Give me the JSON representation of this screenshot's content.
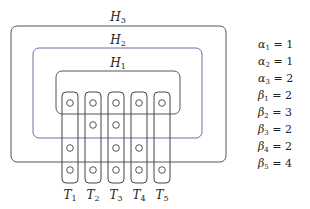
{
  "diagram": {
    "hyperedges": [
      {
        "name": "H",
        "index": "3",
        "box": {
          "x": 11,
          "y": 26,
          "w": 215,
          "h": 136
        },
        "label_pos": {
          "x": 118,
          "y": 11
        },
        "stroke": "#555555"
      },
      {
        "name": "H",
        "index": "2",
        "box": {
          "x": 33,
          "y": 48,
          "w": 169,
          "h": 90
        },
        "label_pos": {
          "x": 118,
          "y": 34
        },
        "stroke": "#6a6fa8"
      },
      {
        "name": "H",
        "index": "1",
        "box": {
          "x": 56,
          "y": 71,
          "w": 124,
          "h": 43
        },
        "label_pos": {
          "x": 118,
          "y": 57
        },
        "stroke": "#555555"
      }
    ],
    "columns": [
      {
        "name": "T",
        "index": "1",
        "cx": 70,
        "circles": [
          103,
          148,
          170
        ]
      },
      {
        "name": "T",
        "index": "2",
        "cx": 93,
        "circles": [
          103,
          125,
          170
        ]
      },
      {
        "name": "T",
        "index": "3",
        "cx": 116,
        "circles": [
          103,
          125,
          148,
          170
        ]
      },
      {
        "name": "T",
        "index": "4",
        "cx": 139,
        "circles": [
          103,
          148,
          170
        ]
      },
      {
        "name": "T",
        "index": "5",
        "cx": 162,
        "circles": [
          103,
          170
        ]
      }
    ],
    "column_box": {
      "top": 92,
      "bottom": 183,
      "half_width": 8
    },
    "column_label_y": 189,
    "alphas": [
      {
        "sym": "α",
        "index": "1",
        "value": "1"
      },
      {
        "sym": "α",
        "index": "2",
        "value": "1"
      },
      {
        "sym": "α",
        "index": "3",
        "value": "2"
      }
    ],
    "betas": [
      {
        "sym": "β",
        "index": "1",
        "value": "2"
      },
      {
        "sym": "β",
        "index": "2",
        "value": "3"
      },
      {
        "sym": "β",
        "index": "3",
        "value": "2"
      },
      {
        "sym": "β",
        "index": "4",
        "value": "2"
      },
      {
        "sym": "β",
        "index": "5",
        "value": "4"
      }
    ],
    "equals": "="
  }
}
